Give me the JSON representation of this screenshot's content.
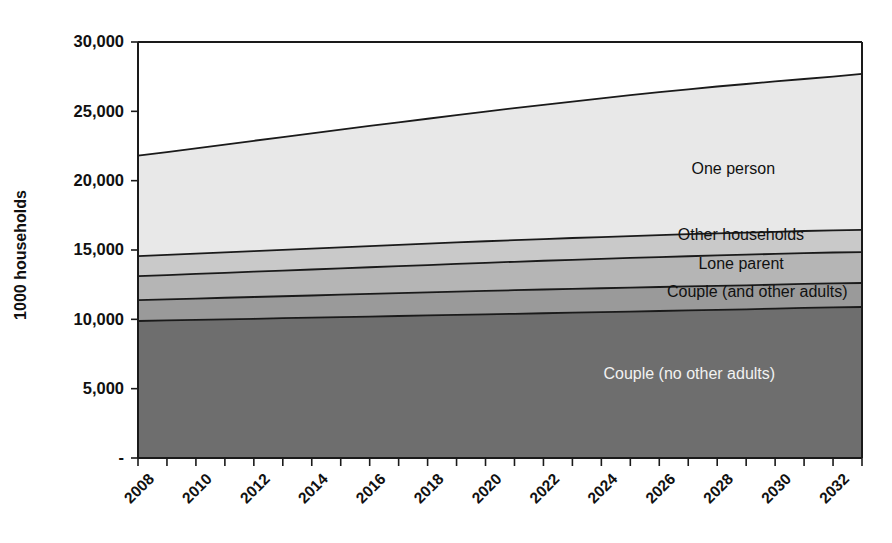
{
  "chart_data": {
    "type": "area",
    "stacked": true,
    "title": "",
    "subtitle": "",
    "xlabel": "",
    "ylabel": "1000 households",
    "x": [
      2008,
      2009,
      2010,
      2011,
      2012,
      2013,
      2014,
      2015,
      2016,
      2017,
      2018,
      2019,
      2020,
      2021,
      2022,
      2023,
      2024,
      2025,
      2026,
      2027,
      2028,
      2029,
      2030,
      2031,
      2032,
      2033
    ],
    "xlim": [
      2008,
      2033
    ],
    "ylim": [
      0,
      30000
    ],
    "yticks": [
      0,
      5000,
      10000,
      15000,
      20000,
      25000,
      30000
    ],
    "ytick_labels": [
      "-",
      "5,000",
      "10,000",
      "15,000",
      "20,000",
      "25,000",
      "30,000"
    ],
    "xtick_labels": [
      "2008",
      "2010",
      "2012",
      "2014",
      "2016",
      "2018",
      "2020",
      "2022",
      "2024",
      "2026",
      "2028",
      "2030",
      "2032"
    ],
    "xtick_step_years": 2,
    "grid": false,
    "legend_position": "inline-labels",
    "series": [
      {
        "name": "Couple (no other adults)",
        "label_color": "#f2f2f2",
        "fill": "#6e6e6e",
        "values": [
          9880,
          9920,
          9960,
          10000,
          10040,
          10080,
          10120,
          10160,
          10200,
          10240,
          10280,
          10320,
          10360,
          10400,
          10440,
          10480,
          10520,
          10560,
          10600,
          10640,
          10680,
          10720,
          10770,
          10820,
          10860,
          10890
        ]
      },
      {
        "name": "Couple (and other adults)",
        "label_color": "#111111",
        "fill": "#9a9a9a",
        "values": [
          1510,
          1525,
          1540,
          1555,
          1570,
          1585,
          1600,
          1615,
          1630,
          1645,
          1660,
          1675,
          1690,
          1700,
          1710,
          1715,
          1720,
          1725,
          1730,
          1730,
          1730,
          1730,
          1730,
          1730,
          1730,
          1730
        ]
      },
      {
        "name": "Lone parent",
        "label_color": "#111111",
        "fill": "#b5b5b5",
        "values": [
          1730,
          1750,
          1775,
          1800,
          1825,
          1850,
          1875,
          1900,
          1925,
          1950,
          1975,
          2000,
          2025,
          2050,
          2075,
          2100,
          2120,
          2140,
          2160,
          2180,
          2200,
          2210,
          2220,
          2225,
          2230,
          2230
        ]
      },
      {
        "name": "Other households",
        "label_color": "#111111",
        "fill": "#c9c9c9",
        "values": [
          1440,
          1450,
          1460,
          1470,
          1480,
          1490,
          1500,
          1510,
          1520,
          1530,
          1540,
          1550,
          1555,
          1560,
          1565,
          1570,
          1575,
          1580,
          1585,
          1588,
          1590,
          1592,
          1594,
          1596,
          1598,
          1600
        ]
      },
      {
        "name": "One person",
        "label_color": "#111111",
        "fill": "#e8e8e8",
        "values": [
          7240,
          7420,
          7600,
          7780,
          7960,
          8140,
          8320,
          8500,
          8670,
          8840,
          9010,
          9180,
          9350,
          9520,
          9680,
          9840,
          10000,
          10160,
          10310,
          10450,
          10590,
          10720,
          10840,
          10960,
          11080,
          11250
        ]
      }
    ],
    "totals": [
      21800,
      22065,
      22335,
      22605,
      22875,
      23145,
      23415,
      23685,
      23945,
      24205,
      24465,
      24725,
      24980,
      25230,
      25470,
      25705,
      25935,
      26165,
      26385,
      26588,
      26790,
      26972,
      27154,
      27331,
      27498,
      27700
    ],
    "annotations": [
      {
        "text": "One person",
        "x": 2030.0,
        "y": 20500
      },
      {
        "text": "Other households",
        "x": 2031.0,
        "y": 15700
      },
      {
        "text": "Lone parent",
        "x": 2030.3,
        "y": 13600
      },
      {
        "text": "Couple (and other adults)",
        "x": 2032.5,
        "y": 11600
      },
      {
        "text": "Couple (no other adults)",
        "x": 2030.0,
        "y": 5700
      }
    ]
  },
  "axis": {
    "y_title": "1000 households"
  }
}
